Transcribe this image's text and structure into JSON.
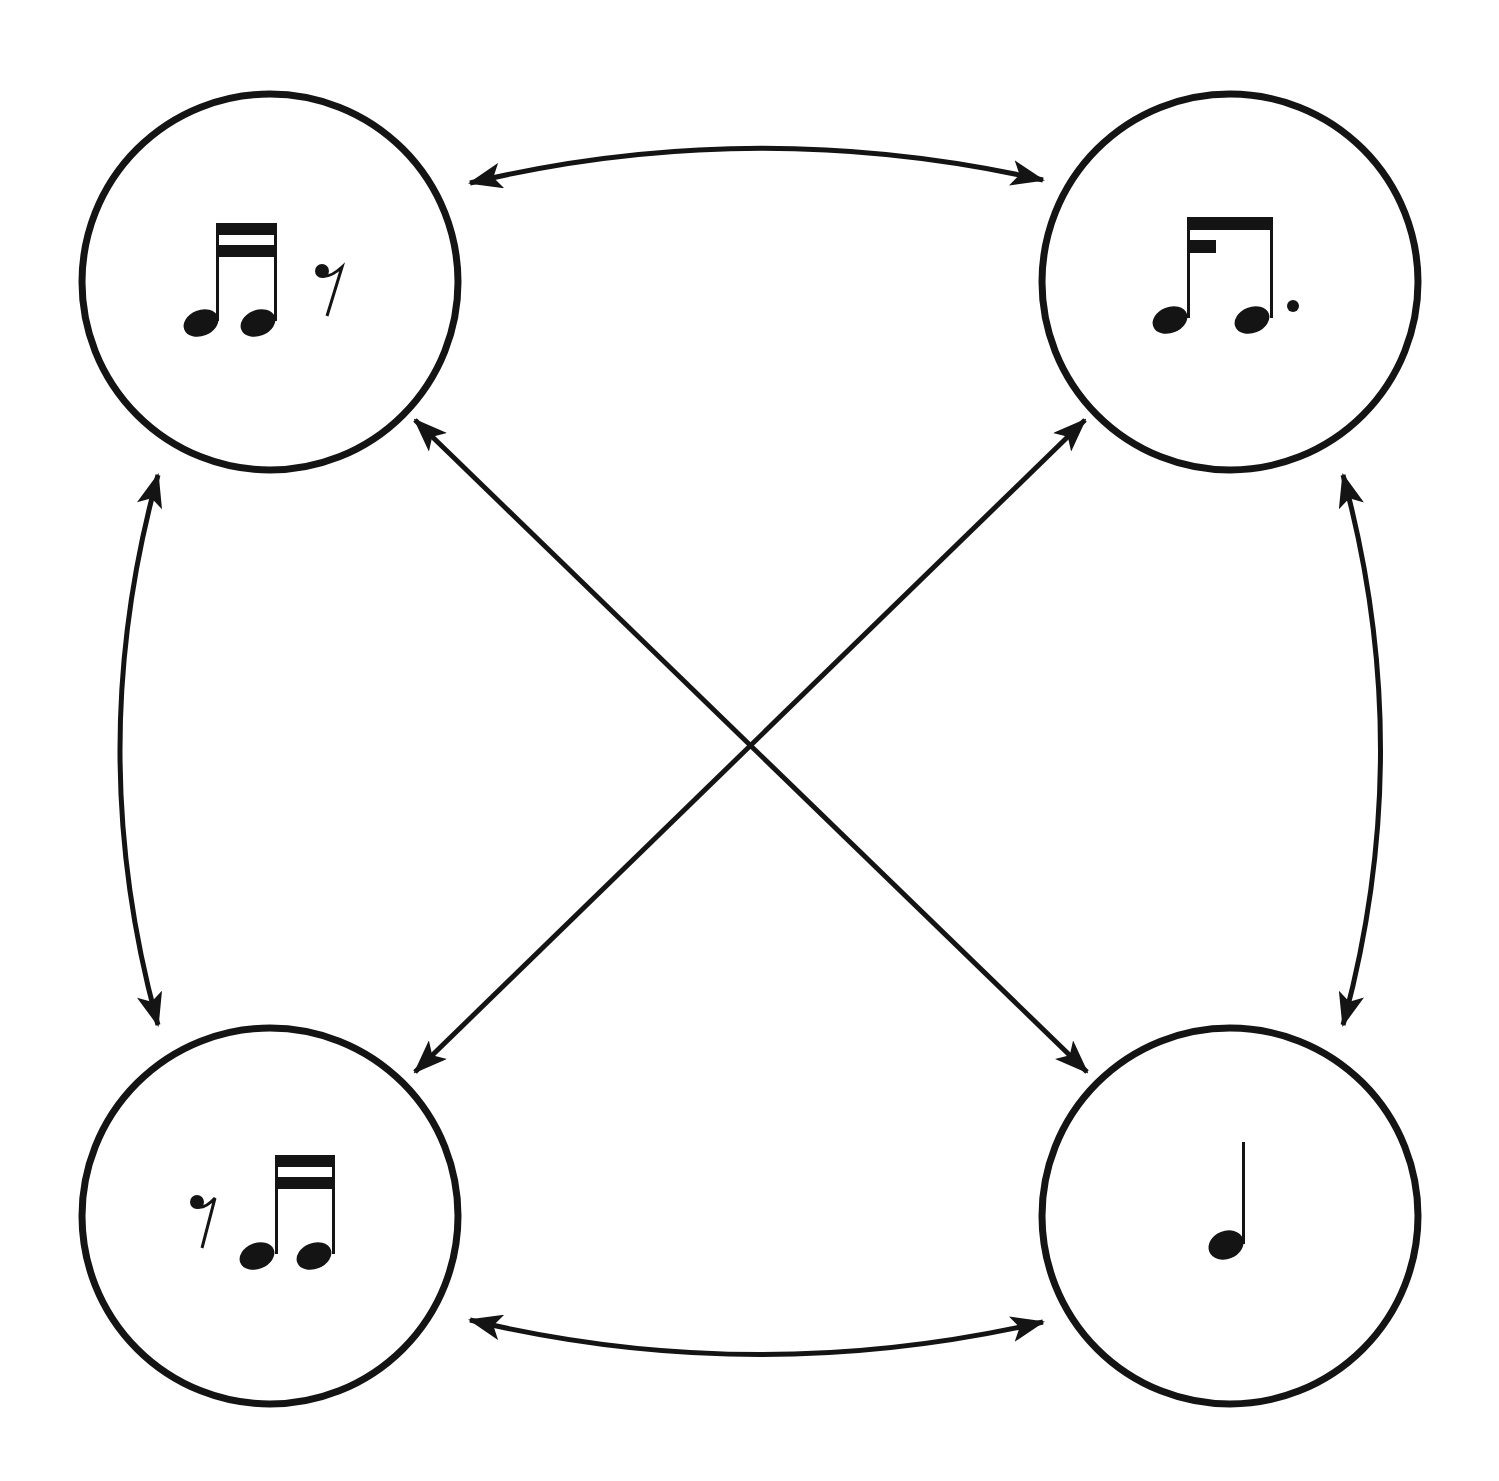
{
  "diagram": {
    "type": "rhythm-transformation-graph",
    "stroke_color": "#141414",
    "background": "#ffffff",
    "nodes": [
      {
        "id": "top-left",
        "label": "two sixteenth notes followed by a sixteenth rest",
        "rhythm": "♬ 𝄿"
      },
      {
        "id": "top-right",
        "label": "dotted-eighth / sixteenth-note pattern",
        "rhythm": "♪. ♬"
      },
      {
        "id": "bottom-left",
        "label": "sixteenth rest followed by two sixteenth notes",
        "rhythm": "𝄿 ♬"
      },
      {
        "id": "bottom-right",
        "label": "single quarter note",
        "rhythm": "♩"
      }
    ],
    "edges": [
      {
        "from": "top-left",
        "to": "top-right",
        "bidirectional": true
      },
      {
        "from": "top-left",
        "to": "bottom-left",
        "bidirectional": true
      },
      {
        "from": "top-right",
        "to": "bottom-right",
        "bidirectional": true
      },
      {
        "from": "bottom-left",
        "to": "bottom-right",
        "bidirectional": true
      },
      {
        "from": "top-left",
        "to": "bottom-right",
        "bidirectional": true
      },
      {
        "from": "top-right",
        "to": "bottom-left",
        "bidirectional": true
      }
    ]
  }
}
